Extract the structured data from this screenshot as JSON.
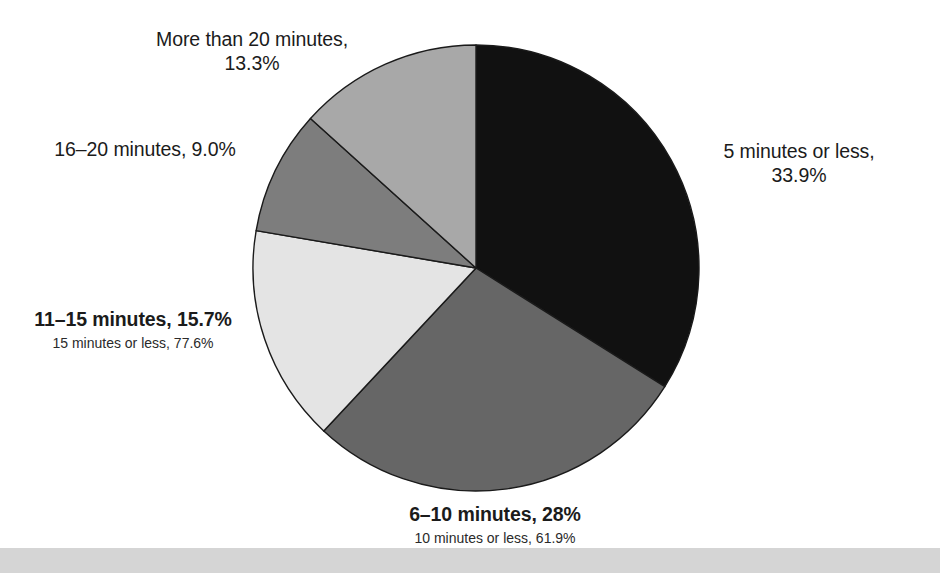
{
  "chart_data": {
    "type": "pie",
    "title": "",
    "categories": [
      "5 minutes or less",
      "6–10 minutes",
      "11–15 minutes",
      "16–20 minutes",
      "More than 20 minutes"
    ],
    "values": [
      33.9,
      28.0,
      15.7,
      9.0,
      13.3
    ],
    "value_labels": [
      "33.9%",
      "28%",
      "15.7%",
      "9.0%",
      "13.3%"
    ],
    "units": "percent",
    "start_angle_deg": 0,
    "direction": "clockwise",
    "legend": "none (direct labels)",
    "grid": false,
    "colors": [
      "#111111",
      "#666666",
      "#e4e4e4",
      "#7d7d7d",
      "#a8a8a8"
    ],
    "slice_border_color": "#1a1a1a",
    "cumulative_annotations": [
      {
        "after_category": "6–10 minutes",
        "text": "10 minutes or less, 61.9%",
        "value": 61.9
      },
      {
        "after_category": "11–15 minutes",
        "text": "15 minutes or less, 77.6%",
        "value": 77.6
      }
    ]
  },
  "labels": {
    "more_than_20": {
      "line1": "More than 20 minutes,",
      "line2": "13.3%"
    },
    "sixteen_to_twenty": {
      "line1": "16–20 minutes, 9.0%"
    },
    "eleven_to_fifteen": {
      "line1": "11–15 minutes, 15.7%",
      "sub": "15 minutes or less, 77.6%"
    },
    "five_or_less": {
      "line1": "5 minutes or less,",
      "line2": "33.9%"
    },
    "six_to_ten": {
      "line1": "6–10 minutes, 28%",
      "sub": "10 minutes or less, 61.9%"
    }
  },
  "figure": {
    "center_x": 476,
    "center_y": 268,
    "radius": 223
  }
}
